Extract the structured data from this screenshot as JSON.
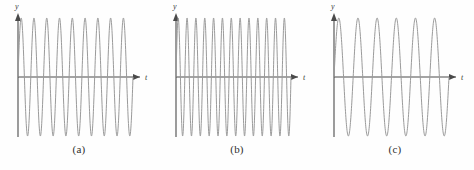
{
  "figure": {
    "background_color": "#fefefe",
    "curve_color": "#9a9a9a",
    "axis_color": "#4a4a4a",
    "label_color": "#3a3a3a",
    "caption_color": "#2e2e2e"
  },
  "panels": [
    {
      "caption": "(a)",
      "y_axis_label": "y",
      "t_axis_label": "t",
      "cycles": 9
    },
    {
      "caption": "(b)",
      "y_axis_label": "y",
      "t_axis_label": "t",
      "cycles": 13
    },
    {
      "caption": "(c)",
      "y_axis_label": "y",
      "t_axis_label": "t",
      "cycles": 6
    }
  ],
  "chart_data": {
    "type": "line",
    "title": "",
    "xlabel": "t",
    "ylabel": "y",
    "grid": false,
    "legend": "none",
    "xlim": [
      0,
      1
    ],
    "ylim": [
      -1,
      1
    ],
    "series": [
      {
        "name": "(a)",
        "function": "y = A sin(2*pi*9*t)",
        "amplitude": 1,
        "cycles": 9,
        "frequency_rank": "medium"
      },
      {
        "name": "(b)",
        "function": "y = A sin(2*pi*13*t)",
        "amplitude": 1,
        "cycles": 13,
        "frequency_rank": "highest"
      },
      {
        "name": "(c)",
        "function": "y = A sin(2*pi*6*t)",
        "amplitude": 1,
        "cycles": 6,
        "frequency_rank": "lowest"
      }
    ]
  }
}
